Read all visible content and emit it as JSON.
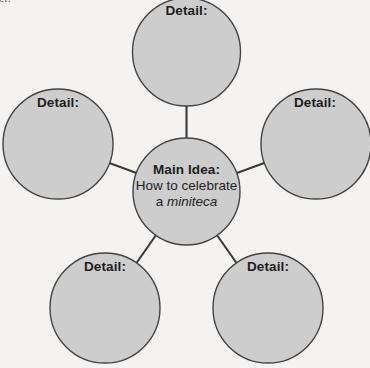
{
  "page": {
    "cut_off_text_fragment": "er.",
    "background_color": "#f4f3f1"
  },
  "diagram": {
    "type": "idea-web",
    "node_fill_color": "#cdcdcd",
    "node_stroke_color": "#444444",
    "connector_color": "#3a3a3a",
    "text_color": "#1d1d1d",
    "center": {
      "title": "Main Idea:",
      "line1": "How to celebrate",
      "line2_prefix": "a ",
      "line2_italic": "miniteca",
      "cx": 186.5,
      "cy": 191.5,
      "r": 53.5
    },
    "details": [
      {
        "label": "Detail:",
        "position": "top",
        "cx": 186.5,
        "cy": 52,
        "r": 54
      },
      {
        "label": "Detail:",
        "position": "left",
        "cx": 58,
        "cy": 144,
        "r": 55
      },
      {
        "label": "Detail:",
        "position": "right",
        "cx": 316,
        "cy": 144,
        "r": 55
      },
      {
        "label": "Detail:",
        "position": "bottom-left",
        "cx": 105,
        "cy": 308,
        "r": 55
      },
      {
        "label": "Detail:",
        "position": "bottom-right",
        "cx": 268,
        "cy": 308,
        "r": 55
      }
    ],
    "connectors": [
      {
        "from": "center",
        "to": "top"
      },
      {
        "from": "center",
        "to": "left"
      },
      {
        "from": "center",
        "to": "right"
      },
      {
        "from": "center",
        "to": "bottom-left"
      },
      {
        "from": "center",
        "to": "bottom-right"
      }
    ]
  }
}
